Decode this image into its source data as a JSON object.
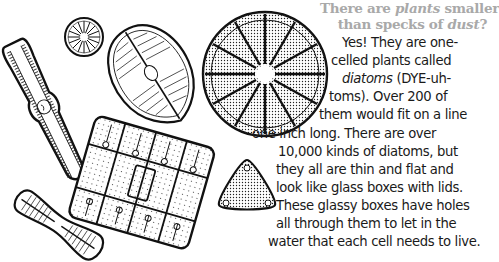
{
  "heading": {
    "line1_a": "There are ",
    "line1_em": "plants",
    "line1_b": " smaller",
    "line2_a": "than specks of ",
    "line2_em": "dust",
    "line2_b": "?",
    "color": "#a9a9a9"
  },
  "body": {
    "lines": [
      "Yes! They are one-",
      "celled plants called",
      "diatoms",
      " (DYE-uh-",
      "toms). Over 200 of",
      "them would fit on a line",
      "one inch long. There are over",
      "10,000 kinds of diatoms, but",
      "they all are thin and flat and",
      "look like glass boxes with lids.",
      "These glassy boxes have holes",
      "all through them to let in the",
      "water that each cell needs to live."
    ],
    "color": "#1a1a1a"
  },
  "illustrations": [
    {
      "name": "elongated-diatom"
    },
    {
      "name": "small-round-diatom"
    },
    {
      "name": "oval-diatom"
    },
    {
      "name": "large-round-diatom"
    },
    {
      "name": "rectangular-colony-diatom"
    },
    {
      "name": "peanut-diatom"
    },
    {
      "name": "triangular-diatom"
    }
  ]
}
